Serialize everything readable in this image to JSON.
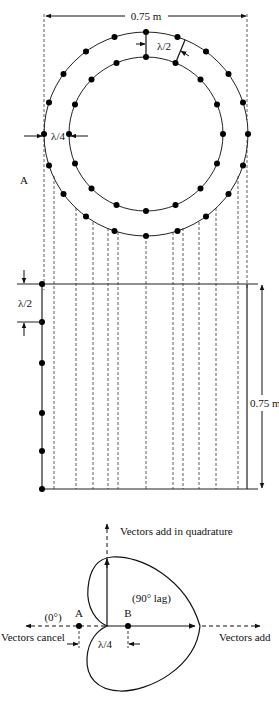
{
  "top_figure": {
    "width_label": "0.75 m",
    "radial_spacing_label": "λ/2",
    "ring_gap_label": "λ/4",
    "point_label": "A",
    "outer_ring_elements": 20,
    "inner_ring_elements": 16
  },
  "middle_figure": {
    "height_label": "0.75 m",
    "spacing_label": "λ/2",
    "array_elements": 6
  },
  "bottom_figure": {
    "vertical_axis_label": "Vectors add in quadrature",
    "left_axis_label": "Vectors cancel",
    "right_axis_label": "Vectors add",
    "phase_a_label": "(0°)",
    "phase_b_label": "(90° lag)",
    "point_a_label": "A",
    "point_b_label": "B",
    "spacing_label": "λ/4"
  }
}
